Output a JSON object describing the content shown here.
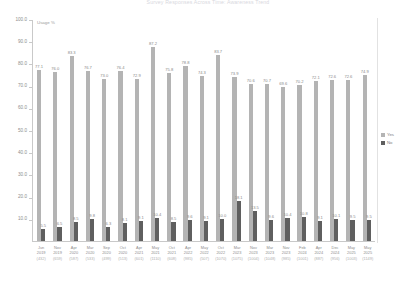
{
  "chart": {
    "title": "Survey Responses Across Time: Awareness Trend",
    "axis_unit_label": "Usage %",
    "y_ticks": [
      "100.0",
      "90.0",
      "80.0",
      "70.0",
      "60.0",
      "50.0",
      "40.0",
      "30.0",
      "20.0",
      "10.0"
    ],
    "legend": [
      {
        "key": "yes",
        "label": "Yes",
        "color": "#b4b4b4"
      },
      {
        "key": "no",
        "label": "No",
        "color": "#5f5f5f"
      }
    ]
  },
  "chart_data": {
    "type": "bar",
    "title": "Survey Responses Across Time: Awareness Trend",
    "xlabel": "",
    "ylabel": "Usage %",
    "ylim": [
      0,
      100
    ],
    "ytick_step": 10,
    "grid": false,
    "legend_position": "right",
    "categories": [
      "Jun\n2019\n(432)",
      "Nov\n2019\n(659)",
      "Apr\n2020\n(587)",
      "Mar\n2020\n(533)",
      "Sep\n2020\n(499)",
      "Oct\n2020\n(513)",
      "Apr\n2021\n(601)",
      "May\n2021\n(1110)",
      "Oct\n2021\n(608)",
      "Apr\n2022\n(985)",
      "May\n2022\n(507)",
      "Oct\n2022\n(1070)",
      "Mar\n2023\n(1075)",
      "Nov\n2023\n(1004)",
      "Mar\n2023\n(1048)",
      "Nov\n2023\n(985)",
      "Feb\n2024\n(1001)",
      "Apr\n2024\n(887)",
      "Dec\n2024\n(956)",
      "May\n2025\n(1003)",
      "May\n2025\n(1149)"
    ],
    "categories_lines": [
      [
        "Jun",
        "2019",
        "(432)"
      ],
      [
        "Nov",
        "2019",
        "(659)"
      ],
      [
        "Apr",
        "2020",
        "(587)"
      ],
      [
        "Mar",
        "2020",
        "(533)"
      ],
      [
        "Sep",
        "2020",
        "(499)"
      ],
      [
        "Oct",
        "2020",
        "(513)"
      ],
      [
        "Apr",
        "2021",
        "(601)"
      ],
      [
        "May",
        "2021",
        "(1110)"
      ],
      [
        "Oct",
        "2021",
        "(608)"
      ],
      [
        "Apr",
        "2022",
        "(985)"
      ],
      [
        "May",
        "2022",
        "(507)"
      ],
      [
        "Oct",
        "2022",
        "(1070)"
      ],
      [
        "Mar",
        "2023",
        "(1075)"
      ],
      [
        "Nov",
        "2023",
        "(1004)"
      ],
      [
        "Mar",
        "2023",
        "(1048)"
      ],
      [
        "Nov",
        "2023",
        "(985)"
      ],
      [
        "Feb",
        "2024",
        "(1001)"
      ],
      [
        "Apr",
        "2024",
        "(887)"
      ],
      [
        "Dec",
        "2024",
        "(956)"
      ],
      [
        "May",
        "2025",
        "(1003)"
      ],
      [
        "May",
        "2025",
        "(1149)"
      ]
    ],
    "series": [
      {
        "name": "Yes",
        "color": "#b4b4b4",
        "values": [
          77.1,
          76.0,
          83.3,
          76.7,
          73.0,
          76.4,
          72.9,
          87.2,
          75.8,
          78.8,
          74.3,
          83.7,
          73.9,
          70.6,
          70.7,
          69.6,
          70.2,
          72.1,
          72.6,
          72.6,
          74.9
        ]
      },
      {
        "name": "No",
        "color": "#5f5f5f",
        "values": [
          5.5,
          6.5,
          8.5,
          9.8,
          6.3,
          8.1,
          9.1,
          10.4,
          8.5,
          9.6,
          9.1,
          10.0,
          18.1,
          13.5,
          9.6,
          10.4,
          10.8,
          9.1,
          10.1,
          9.5,
          9.5
        ]
      }
    ]
  }
}
